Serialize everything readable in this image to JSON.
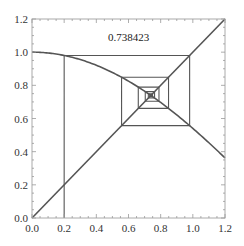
{
  "chart_data": {
    "type": "line",
    "title": "",
    "xlabel": "",
    "ylabel": "",
    "xlim": [
      0,
      1.2
    ],
    "ylim": [
      0,
      1.2
    ],
    "grid": false,
    "x_ticks": [
      "0.0",
      "0.2",
      "0.4",
      "0.6",
      "0.8",
      "1.0",
      "1.2"
    ],
    "y_ticks": [
      "0.0",
      "0.2",
      "0.4",
      "0.6",
      "0.8",
      "1.0",
      "1.2"
    ],
    "annotation": {
      "text": "0.738423",
      "x": 0.6,
      "y": 1.07
    },
    "series": [
      {
        "name": "cos(x)",
        "function": "cos",
        "x_range": [
          0,
          1.2
        ]
      },
      {
        "name": "y = x",
        "function": "identity",
        "x_range": [
          0,
          1.2
        ]
      },
      {
        "name": "cobweb",
        "x0": 0.2,
        "iterations": 30,
        "fixed_point": 0.738423
      }
    ],
    "line_color": "#555555"
  }
}
